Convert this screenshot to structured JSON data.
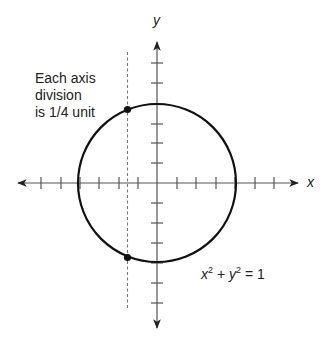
{
  "diagram": {
    "note_lines": [
      "Each axis",
      "division",
      "is 1/4 unit"
    ],
    "x_axis_label": "x",
    "y_axis_label": "y",
    "equation": {
      "var1": "x",
      "exp1": "2",
      "plus": "+",
      "var2": "y",
      "exp2": "2",
      "equals": "= 1"
    },
    "axis_division_unit": "1/4",
    "circle": {
      "center": [
        0,
        0
      ],
      "radius": 1
    },
    "x_ticks_per_side": 4,
    "y_ticks_per_side": 4,
    "vertical_line_x": -0.375,
    "points": [
      {
        "label": "upper-intersection",
        "x": -0.375,
        "y": 0.93
      },
      {
        "label": "lower-intersection",
        "x": -0.375,
        "y": -0.93
      }
    ],
    "colors": {
      "stroke": "#111111",
      "axis": "#555555",
      "dashed": "#777777"
    }
  }
}
